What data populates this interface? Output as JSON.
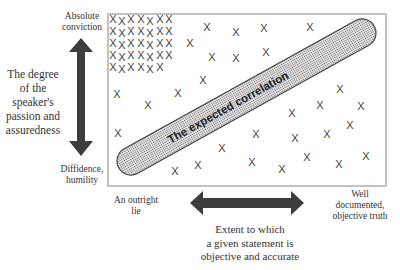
{
  "labels": {
    "top": "Absolute conviction",
    "bottom": "Diffidence, humility",
    "left_axis": [
      "The degree",
      "of the",
      "speaker's",
      "passion and",
      "assuredness"
    ],
    "left_end": [
      "An outright",
      "lie"
    ],
    "right_end": [
      "Well",
      "documented,",
      "objective truth"
    ],
    "bottom_axis": [
      "Extent to which",
      "a given statement is",
      "objective and accurate"
    ],
    "correlation": "The expected correlation"
  },
  "colors": {
    "arrow": "#3d3d3d",
    "box_border": "#9a9a9a",
    "pill_fill": "#cfcfcf",
    "pill_stroke": "#444444",
    "xmark": "#444444"
  },
  "box": {
    "x": 108,
    "y": 14,
    "w": 278,
    "h": 172
  },
  "pill": {
    "x1": 131,
    "y1": 161,
    "x2": 362,
    "y2": 33,
    "radius": 14
  },
  "cluster": {
    "rows": [
      [
        113,
        122,
        131,
        141,
        150,
        160,
        169
      ],
      [
        113,
        122,
        131,
        141,
        150,
        160,
        169
      ],
      [
        113,
        122,
        131,
        141,
        150,
        160,
        169
      ],
      [
        113,
        122,
        131,
        141,
        150,
        160,
        169
      ],
      [
        113,
        122,
        131,
        141,
        150,
        160
      ]
    ],
    "row_y": [
      19,
      31,
      43,
      55,
      67
    ]
  },
  "scatter": [
    [
      207,
      27
    ],
    [
      236,
      32
    ],
    [
      264,
      28
    ],
    [
      310,
      27
    ],
    [
      190,
      43
    ],
    [
      212,
      57
    ],
    [
      236,
      58
    ],
    [
      266,
      52
    ],
    [
      203,
      80
    ],
    [
      117,
      94
    ],
    [
      178,
      93
    ],
    [
      148,
      105
    ],
    [
      340,
      89
    ],
    [
      320,
      105
    ],
    [
      361,
      106
    ],
    [
      292,
      113
    ],
    [
      350,
      125
    ],
    [
      118,
      133
    ],
    [
      256,
      134
    ],
    [
      295,
      138
    ],
    [
      327,
      134
    ],
    [
      222,
      148
    ],
    [
      198,
      165
    ],
    [
      175,
      171
    ],
    [
      252,
      162
    ],
    [
      282,
      169
    ],
    [
      307,
      157
    ],
    [
      339,
      164
    ],
    [
      366,
      156
    ]
  ]
}
